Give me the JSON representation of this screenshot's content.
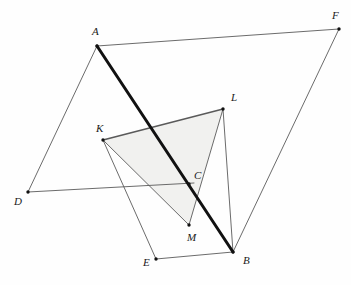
{
  "figure": {
    "background_color": "#fefefe",
    "stroke_color": "#5a5a5a",
    "bold_stroke_color": "#111111",
    "shade_fill": "#f1f1ef",
    "shade_stroke": "#8a8a8a",
    "label_color": "#1a1a1a",
    "width": 351,
    "height": 285
  },
  "points": {
    "A": {
      "label": "A",
      "x": 97,
      "y": 46,
      "label_x": 92,
      "label_y": 35
    },
    "B": {
      "label": "B",
      "x": 233,
      "y": 252,
      "label_x": 243,
      "label_y": 264
    },
    "C": {
      "label": "C",
      "x": 189,
      "y": 184,
      "label_x": 194,
      "label_y": 179
    },
    "D": {
      "label": "D",
      "x": 28,
      "y": 192,
      "label_x": 14,
      "label_y": 205
    },
    "E": {
      "label": "E",
      "x": 156,
      "y": 259,
      "label_x": 143,
      "label_y": 266
    },
    "F": {
      "label": "F",
      "x": 339,
      "y": 29,
      "label_x": 332,
      "label_y": 19
    },
    "K": {
      "label": "K",
      "x": 103,
      "y": 140,
      "label_x": 96,
      "label_y": 132
    },
    "L": {
      "label": "L",
      "x": 223,
      "y": 109,
      "label_x": 231,
      "label_y": 101
    },
    "M": {
      "label": "M",
      "x": 189,
      "y": 225,
      "label_x": 187,
      "label_y": 241
    }
  },
  "shaded_region": {
    "name": "triangle-KLM",
    "vertices": "K,L,M",
    "path": "103,140 223,109 189,225",
    "fill": "#f1f1ef"
  },
  "segments": [
    {
      "name": "segment-AF",
      "from": "A",
      "to": "F",
      "weight": "thin",
      "path": "97,46 339,29"
    },
    {
      "name": "segment-AD",
      "from": "A",
      "to": "D",
      "weight": "thin",
      "path": "97,46 28,192"
    },
    {
      "name": "segment-AB",
      "from": "A",
      "to": "B",
      "weight": "bold",
      "path": "97,46 233,252"
    },
    {
      "name": "segment-FB",
      "from": "F",
      "to": "B",
      "weight": "thin",
      "path": "339,29 233,252"
    },
    {
      "name": "segment-DC",
      "from": "D",
      "to": "C",
      "weight": "thin",
      "path": "28,192 194,183"
    },
    {
      "name": "segment-EB",
      "from": "E",
      "to": "B",
      "weight": "thin",
      "path": "156,259 233,252"
    },
    {
      "name": "segment-KL",
      "from": "K",
      "to": "L",
      "weight": "medium",
      "path": "103,140 223,109"
    },
    {
      "name": "segment-KM",
      "from": "K",
      "to": "M",
      "weight": "thin",
      "path": "103,140 189,225"
    },
    {
      "name": "segment-LM",
      "from": "L",
      "to": "M",
      "weight": "thin",
      "path": "223,109 189,225"
    },
    {
      "name": "segment-KE",
      "from": "K",
      "to": "E",
      "weight": "thin",
      "path": "103,140 156,259"
    },
    {
      "name": "segment-LB",
      "from": "L",
      "to": "B",
      "weight": "thin",
      "path": "223,109 233,252"
    }
  ],
  "vertex_markers": [
    "A",
    "B",
    "C",
    "D",
    "E",
    "F",
    "K",
    "L",
    "M"
  ]
}
